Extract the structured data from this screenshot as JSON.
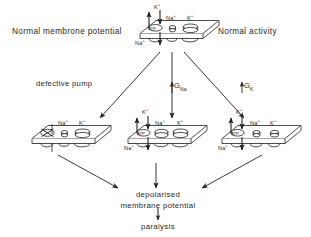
{
  "diagram": {
    "ink_color": "#1f1f1f",
    "background": "#ffffff"
  },
  "side_labels": {
    "left": "Normal membrone potential",
    "right": "Normal activity"
  },
  "branch_labels": {
    "left": "defective pump",
    "middle_prefix": "↑",
    "middle": "G",
    "middle_sub": "Na",
    "right_prefix": "↑",
    "right": "G",
    "right_sub": "K"
  },
  "membranes": [
    {
      "id": "top-membrane",
      "name": "normal-membrane",
      "pump": {
        "label": "ATP",
        "crossed_out": false
      },
      "ion_in_top": "K",
      "ion_in_sup": "+",
      "ion_out_bottom": "Na",
      "ion_out_sup": "+",
      "channels": [
        {
          "ion": "Na",
          "sup": "+",
          "width": "narrow"
        },
        {
          "ion": "K",
          "sup": "+",
          "width": "wide"
        }
      ]
    },
    {
      "id": "left-membrane",
      "name": "defective-pump-membrane",
      "pump": {
        "label": "",
        "crossed_out": true
      },
      "ion_in_top": "",
      "ion_in_sup": "",
      "ion_out_bottom": "",
      "ion_out_sup": "",
      "channels": [
        {
          "ion": "Na",
          "sup": "+",
          "width": "narrow"
        },
        {
          "ion": "K",
          "sup": "+",
          "width": "wide"
        }
      ]
    },
    {
      "id": "middle-membrane",
      "name": "increased-gna-membrane",
      "pump": {
        "label": "ATP",
        "crossed_out": false
      },
      "ion_in_top": "K",
      "ion_in_sup": "+",
      "ion_out_bottom": "Na",
      "ion_out_sup": "+",
      "channels": [
        {
          "ion": "Na",
          "sup": "+",
          "width": "wide"
        },
        {
          "ion": "K",
          "sup": "+",
          "width": "wide"
        }
      ]
    },
    {
      "id": "right-membrane",
      "name": "increased-gk-membrane",
      "pump": {
        "label": "ATP",
        "crossed_out": false
      },
      "ion_in_top": "K",
      "ion_in_sup": "+",
      "ion_out_bottom": "Na",
      "ion_out_sup": "+",
      "channels": [
        {
          "ion": "Na",
          "sup": "+",
          "width": "narrow"
        },
        {
          "ion": "K",
          "sup": "+",
          "width": "narrow"
        }
      ]
    }
  ],
  "outcomes": {
    "depolarised_line1": "depolarised",
    "depolarised_line2": "membrane potential",
    "paralysis": "paralysis"
  },
  "ion_texts": {
    "na": "Na",
    "k": "K",
    "plus": "+"
  }
}
